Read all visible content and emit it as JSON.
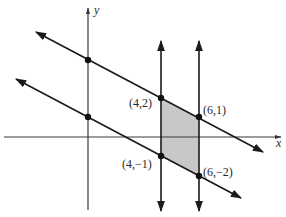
{
  "figure": {
    "x_axis_label": "x",
    "y_axis_label": "y",
    "points": [
      {
        "label": "(4,2)",
        "x": 4,
        "y": 2
      },
      {
        "label": "(6,1)",
        "x": 6,
        "y": 1
      },
      {
        "label": "(4,−1)",
        "x": 4,
        "y": -1
      },
      {
        "label": "(6,−2)",
        "x": 6,
        "y": -2
      }
    ],
    "y_intercepts": [
      {
        "x": 0,
        "y": 4
      },
      {
        "x": 0,
        "y": 1
      }
    ],
    "lines": [
      {
        "name": "upper-diagonal",
        "equation": "y = -x/2 + 4"
      },
      {
        "name": "lower-diagonal",
        "equation": "y = -x/2 + 1"
      },
      {
        "name": "vertical-left",
        "equation": "x = 4"
      },
      {
        "name": "vertical-right",
        "equation": "x = 6"
      }
    ],
    "shaded_region": "parallelogram (4,2)-(6,1)-(6,-2)-(4,-1)",
    "colors": {
      "line": "#1a1a1a",
      "axis": "#3a3a3a",
      "shade": "#c8c8c8"
    }
  }
}
